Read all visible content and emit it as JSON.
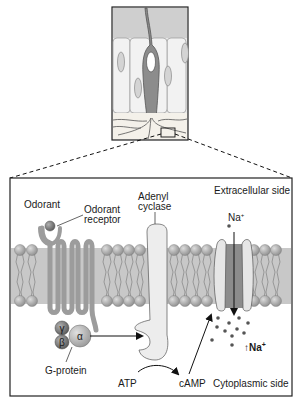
{
  "labels": {
    "odorant": "Odorant",
    "odorant_receptor_1": "Odorant",
    "odorant_receptor_2": "receptor",
    "adenyl_1": "Adenyl",
    "adenyl_2": "cyclase",
    "extracellular": "Extracellular side",
    "cytoplasmic": "Cytoplasmic side",
    "na_top": "Na",
    "na_sup": "+",
    "na_bottom": "↑Na",
    "na_bottom_sup": "+",
    "gprotein": "G-protein",
    "atp": "ATP",
    "camp": "cAMP",
    "gamma": "γ",
    "beta": "β",
    "alpha": "α"
  },
  "colors": {
    "membrane_bg": "#c8c8c8",
    "lipid_head": "#a8a8a8",
    "receptor": "#a0a0a0",
    "cyclase": "#ececec",
    "channel_outer": "#e6e6e6",
    "channel_pore": "#8c8c8c",
    "inset_top": "#d8d8d8",
    "cell_fill": "#ececec",
    "neuron": "#8c8c8c"
  }
}
